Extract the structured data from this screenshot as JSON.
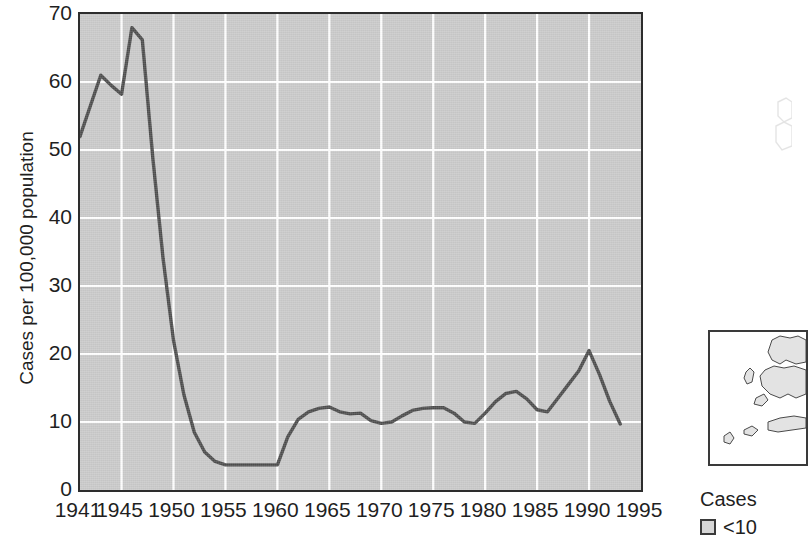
{
  "chart_data": {
    "type": "line",
    "title": "",
    "xlabel": "",
    "ylabel": "Cases per 100,000 population",
    "xlim": [
      1941,
      1995
    ],
    "ylim": [
      0,
      70
    ],
    "grid": true,
    "legend_position": "right",
    "line_color": "#4d4d4d",
    "plot_background": "#c9c9c9",
    "gridline_color": "#ffffff",
    "axis_color": "#2d2d2d",
    "ytick_labels": [
      "70",
      "60",
      "50",
      "40",
      "30",
      "20",
      "10",
      "0"
    ],
    "ytick_values": [
      70,
      60,
      50,
      40,
      30,
      20,
      10,
      0
    ],
    "xtick_labels": [
      "1941",
      "1945",
      "1950",
      "1955",
      "1960",
      "1965",
      "1970",
      "1975",
      "1980",
      "1985",
      "1990",
      "1995"
    ],
    "xtick_values": [
      1941,
      1945,
      1950,
      1955,
      1960,
      1965,
      1970,
      1975,
      1980,
      1985,
      1990,
      1995
    ],
    "x": [
      1941,
      1942,
      1943,
      1944,
      1945,
      1946,
      1947,
      1948,
      1949,
      1950,
      1951,
      1952,
      1953,
      1954,
      1955,
      1956,
      1957,
      1958,
      1959,
      1960,
      1961,
      1962,
      1963,
      1964,
      1965,
      1966,
      1967,
      1968,
      1969,
      1970,
      1971,
      1972,
      1973,
      1974,
      1975,
      1976,
      1977,
      1978,
      1979,
      1980,
      1981,
      1982,
      1983,
      1984,
      1985,
      1986,
      1987,
      1988,
      1989,
      1990,
      1991,
      1992,
      1993
    ],
    "values": [
      52.0,
      56.5,
      61.0,
      59.5,
      58.2,
      68.0,
      66.2,
      49.0,
      34.0,
      22.0,
      14.0,
      8.5,
      5.6,
      4.2,
      3.7,
      3.7,
      3.7,
      3.7,
      3.7,
      3.7,
      7.8,
      10.4,
      11.5,
      12.0,
      12.2,
      11.5,
      11.2,
      11.3,
      10.2,
      9.8,
      10.0,
      10.9,
      11.7,
      12.0,
      12.1,
      12.1,
      11.3,
      10.0,
      9.8,
      11.3,
      13.0,
      14.2,
      14.5,
      13.4,
      11.8,
      11.5,
      13.5,
      15.5,
      17.5,
      20.5,
      17.0,
      13.0,
      9.7
    ],
    "series_name": "Cases per 100,000 population"
  },
  "map_inset": {
    "present": true,
    "cut_off": true,
    "description": "coastline-outline-map"
  },
  "legend": {
    "title": "Cases",
    "entries": [
      {
        "label": "<10",
        "color": "#d6d6d6"
      }
    ]
  }
}
